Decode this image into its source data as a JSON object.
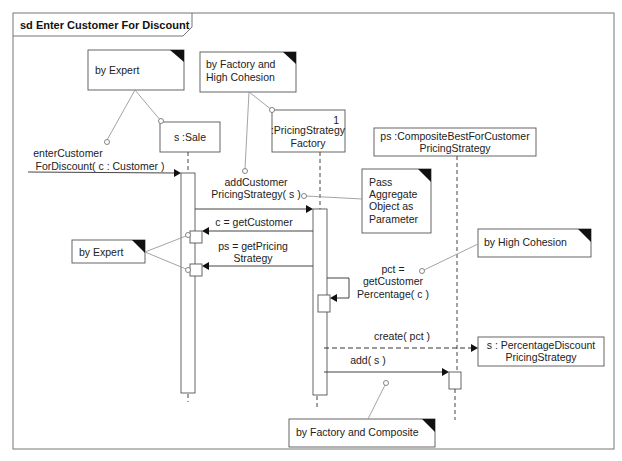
{
  "frame": {
    "title": "sd Enter Customer For Discount"
  },
  "lifelines": [
    {
      "id": "sale",
      "label": [
        "s :Sale"
      ]
    },
    {
      "id": "factory",
      "label": [
        ":PricingStrategy",
        "Factory"
      ],
      "multiplicity": "1"
    },
    {
      "id": "composite",
      "label": [
        "ps :CompositeBestForCustomer",
        "PricingStrategy"
      ]
    },
    {
      "id": "percentage",
      "label": [
        "s : PercentageDiscount",
        "PricingStrategy"
      ]
    }
  ],
  "messages": [
    {
      "id": "enterCustomer",
      "label": [
        "enterCustomer",
        "ForDiscount( c : Customer )"
      ],
      "type": "sync"
    },
    {
      "id": "addCustomer",
      "label": [
        "addCustomer",
        "PricingStrategy( s )"
      ],
      "type": "sync"
    },
    {
      "id": "getCustomer",
      "label": [
        "c = getCustomer"
      ],
      "type": "sync"
    },
    {
      "id": "getPricing",
      "label": [
        "ps = getPricing",
        "Strategy"
      ],
      "type": "sync"
    },
    {
      "id": "getPct",
      "label": [
        "pct =",
        "getCustomer",
        "Percentage( c )"
      ],
      "type": "self"
    },
    {
      "id": "create",
      "label": [
        "create( pct )"
      ],
      "type": "create"
    },
    {
      "id": "add",
      "label": [
        "add( s )"
      ],
      "type": "sync"
    }
  ],
  "notes": [
    {
      "id": "by-expert-top",
      "text": [
        "by Expert"
      ]
    },
    {
      "id": "by-factory-cohesion",
      "text": [
        "by Factory and",
        "High Cohesion"
      ]
    },
    {
      "id": "pass-aggregate",
      "text": [
        "Pass",
        "Aggregate",
        "Object as",
        "Parameter"
      ]
    },
    {
      "id": "by-expert-left",
      "text": [
        "by Expert"
      ]
    },
    {
      "id": "by-high-cohesion",
      "text": [
        "by High Cohesion"
      ]
    },
    {
      "id": "by-factory-composite",
      "text": [
        "by Factory and Composite"
      ]
    }
  ]
}
